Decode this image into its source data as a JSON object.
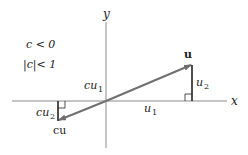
{
  "diagram": {
    "conditions": [
      "c < 0",
      "|c|< 1"
    ],
    "axes": {
      "x_label": "x",
      "y_label": "y"
    },
    "vectors": {
      "u": {
        "label": "u",
        "x_component": "u",
        "x_sub": "1",
        "y_component": "u",
        "y_sub": "2"
      },
      "cu": {
        "label": "cu",
        "x_component": "cu",
        "x_sub": "1",
        "y_component": "cu",
        "y_sub": "2"
      }
    },
    "colors": {
      "vector": "#777777",
      "axis": "#777777",
      "component": "#222222",
      "text": "#222222"
    }
  }
}
